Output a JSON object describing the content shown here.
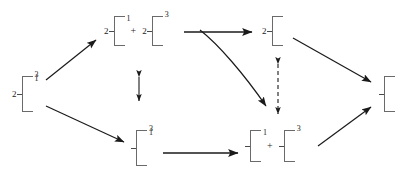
{
  "diagram": {
    "type": "bracket-transformation-scheme",
    "symbols": {
      "plus": "+",
      "dash": "–"
    },
    "nodes": [
      {
        "id": "source",
        "name": "source-node",
        "position": "left-center",
        "prefix": "2",
        "top_label": "1",
        "bottom_label": "3",
        "x": 12,
        "y": 76,
        "height": 36
      },
      {
        "id": "top-a",
        "name": "top-product-a",
        "position": "top-row-first",
        "prefix": "2",
        "top_label": "1",
        "bottom_label": "",
        "x": 104,
        "y": 16,
        "height": 30
      },
      {
        "id": "top-b",
        "name": "top-product-b",
        "position": "top-row-second",
        "prefix": "2",
        "top_label": "",
        "bottom_label": "3",
        "x": 154,
        "y": 16,
        "height": 30
      },
      {
        "id": "top-c",
        "name": "top-result-node",
        "position": "top-row-right",
        "prefix": "2",
        "top_label": "",
        "bottom_label": "",
        "x": 262,
        "y": 16,
        "height": 30
      },
      {
        "id": "bottom-a",
        "name": "bottom-source-node",
        "position": "bottom-row-left",
        "prefix": "",
        "top_label": "1",
        "bottom_label": "3",
        "x": 131,
        "y": 130,
        "height": 36
      },
      {
        "id": "bottom-b",
        "name": "bottom-product-a",
        "position": "bottom-row-second",
        "prefix": "",
        "top_label": "1",
        "bottom_label": "",
        "x": 245,
        "y": 130,
        "height": 32
      },
      {
        "id": "bottom-c",
        "name": "bottom-product-b",
        "position": "bottom-row-third",
        "prefix": "",
        "top_label": "",
        "bottom_label": "3",
        "x": 298,
        "y": 130,
        "height": 32
      },
      {
        "id": "sink",
        "name": "sink-node",
        "position": "right-center",
        "prefix": "",
        "top_label": "",
        "bottom_label": "",
        "x": 379,
        "y": 76,
        "height": 36
      }
    ],
    "operators": [
      {
        "id": "plus-top",
        "name": "plus-operator-top",
        "label": "+",
        "x": 136,
        "y": 30
      },
      {
        "id": "plus-bottom",
        "name": "plus-operator-bottom",
        "label": "+",
        "x": 279,
        "y": 146
      }
    ],
    "arrows": [
      {
        "id": "a1",
        "name": "arrow-source-to-top",
        "style": "solid",
        "kind": "single",
        "direction": "up-right"
      },
      {
        "id": "a2",
        "name": "arrow-source-to-bottom",
        "style": "solid",
        "kind": "single",
        "direction": "down-right"
      },
      {
        "id": "a3",
        "name": "arrow-top-horizontal",
        "style": "solid",
        "kind": "single",
        "direction": "right"
      },
      {
        "id": "a4",
        "name": "arrow-top-curved-to-bottom",
        "style": "solid",
        "kind": "single-curved",
        "direction": "down-right"
      },
      {
        "id": "a5",
        "name": "arrow-bottom-horizontal",
        "style": "solid",
        "kind": "single",
        "direction": "right"
      },
      {
        "id": "a6",
        "name": "arrow-top-result-to-sink",
        "style": "solid",
        "kind": "single",
        "direction": "down-right"
      },
      {
        "id": "a7",
        "name": "arrow-bottom-result-to-sink",
        "style": "solid",
        "kind": "single",
        "direction": "up-right"
      },
      {
        "id": "a8",
        "name": "equilibrium-arrow-center",
        "style": "solid",
        "kind": "double-headed-vertical",
        "direction": "up-down"
      },
      {
        "id": "a9",
        "name": "equilibrium-arrow-dashed-right",
        "style": "dashed",
        "kind": "double-headed-vertical",
        "direction": "up-down"
      }
    ],
    "colors": {
      "background": "#ffffff",
      "stroke": "#1a1a1a",
      "bracket_stroke": "#6a6a6a",
      "text": "#1a1a1a"
    }
  }
}
